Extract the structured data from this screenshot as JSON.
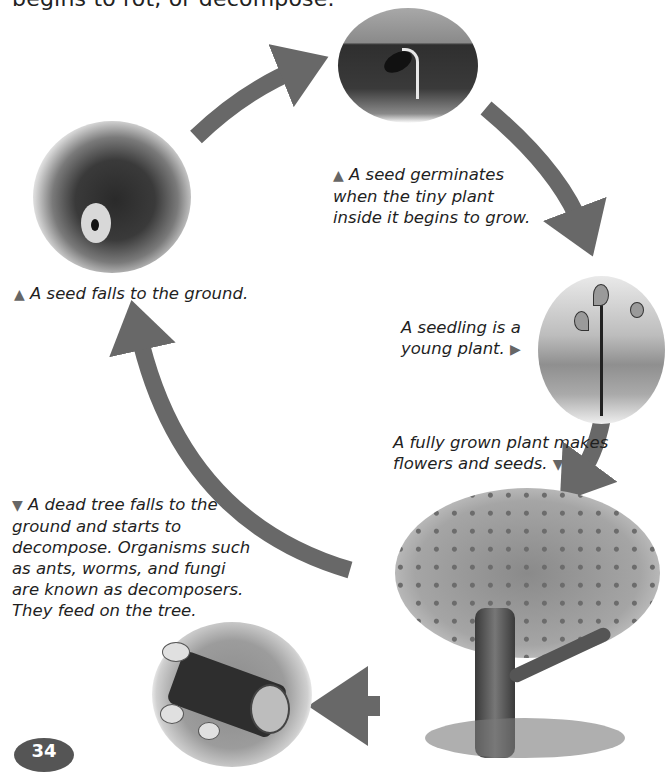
{
  "page": {
    "header_text": "begins to rot, or decompose.",
    "page_number": "34"
  },
  "diagram": {
    "arrow_color": "#686868",
    "stages": [
      {
        "id": "seed-falls",
        "image": "rotting-fruit-with-seeds",
        "caption_marker": "▲",
        "caption": "A seed falls to the ground."
      },
      {
        "id": "germination",
        "image": "germinating-seed-in-soil",
        "caption_marker": "▲",
        "caption_lines": [
          "A seed germinates",
          "when the tiny plant",
          "inside it begins to grow."
        ]
      },
      {
        "id": "seedling",
        "image": "young-seedling",
        "caption_lines": [
          "A seedling is a",
          "young plant."
        ],
        "caption_marker": "▶"
      },
      {
        "id": "mature-plant",
        "image": "fruit-tree",
        "caption_lines": [
          "A fully grown plant makes",
          "flowers and seeds."
        ],
        "caption_marker": "▼"
      },
      {
        "id": "decomposition",
        "image": "fallen-log-with-mushrooms",
        "caption_marker": "▼",
        "caption_lines": [
          "A dead tree falls to the",
          "ground and starts to",
          "decompose. Organisms such",
          "as ants, worms, and fungi",
          "are known as decomposers.",
          "They feed on the tree."
        ]
      }
    ]
  }
}
